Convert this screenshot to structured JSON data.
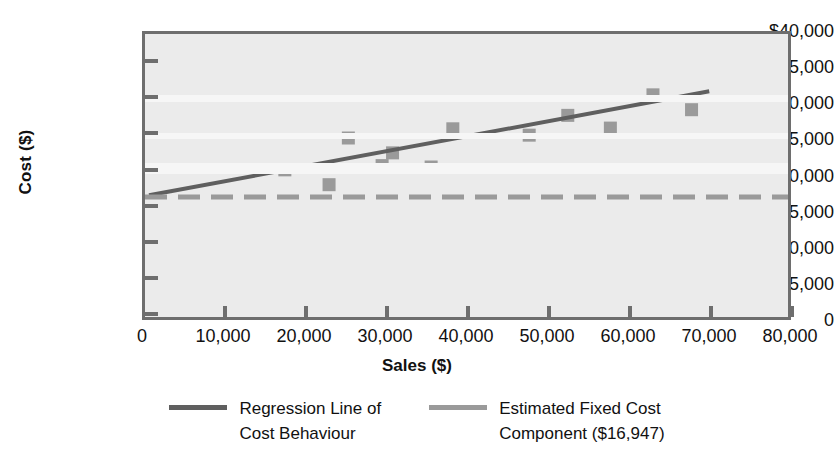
{
  "chart_data": {
    "type": "scatter",
    "title": "",
    "xlabel": "Sales ($)",
    "ylabel": "Cost ($)",
    "xlim": [
      0,
      80000
    ],
    "ylim": [
      0,
      40000
    ],
    "grid": false,
    "legend_position": "bottom",
    "xticks": [
      "0",
      "10,000",
      "20,000",
      "30,000",
      "40,000",
      "50,000",
      "60,000",
      "70,000",
      "80,000"
    ],
    "xtick_values": [
      0,
      10000,
      20000,
      30000,
      40000,
      50000,
      60000,
      70000,
      80000
    ],
    "yticks": [
      "0",
      "5,000",
      "10,000",
      "15,000",
      "20,000",
      "25,000",
      "30,000",
      "35,000",
      "$40,000"
    ],
    "ytick_values": [
      0,
      5000,
      10000,
      15000,
      20000,
      25000,
      30000,
      35000,
      40000
    ],
    "series": [
      {
        "name": "Observed Cost Data",
        "type": "scatter",
        "marker": "square",
        "color": "#9a9a9a",
        "points": [
          {
            "x": 17400,
            "y": 20800
          },
          {
            "x": 22900,
            "y": 18700
          },
          {
            "x": 25300,
            "y": 25300
          },
          {
            "x": 29500,
            "y": 21400
          },
          {
            "x": 30800,
            "y": 23200
          },
          {
            "x": 35600,
            "y": 21200
          },
          {
            "x": 38300,
            "y": 26600
          },
          {
            "x": 47800,
            "y": 25700
          },
          {
            "x": 52600,
            "y": 28500
          },
          {
            "x": 57900,
            "y": 26700
          },
          {
            "x": 63200,
            "y": 31400
          },
          {
            "x": 68000,
            "y": 29300
          }
        ]
      },
      {
        "name": "Regression Line of Cost Behaviour",
        "type": "line",
        "style": "solid",
        "color": "#5f5f5f",
        "points": [
          {
            "x": 500,
            "y": 17200
          },
          {
            "x": 70200,
            "y": 31900
          }
        ]
      },
      {
        "name": "Estimated Fixed Cost Component ($16,947)",
        "type": "line",
        "style": "dashed",
        "color": "#9a9a9a",
        "value": 16947,
        "points": [
          {
            "x": 0,
            "y": 16947
          },
          {
            "x": 80000,
            "y": 16947
          }
        ]
      }
    ]
  },
  "legend": {
    "items": [
      {
        "label": "Regression Line of\nCost Behaviour",
        "color": "#5f5f5f",
        "style": "solid"
      },
      {
        "label": "Estimated Fixed Cost\nComponent ($16,947)",
        "color": "#9a9a9a",
        "style": "dashed"
      }
    ]
  },
  "colors": {
    "plot_background": "#ebebeb",
    "axis": "#6e6e6e",
    "marker": "#9a9a9a",
    "regression_line": "#5f5f5f",
    "fixed_cost_line": "#9a9a9a",
    "text": "#111111",
    "page_background": "#ffffff"
  }
}
